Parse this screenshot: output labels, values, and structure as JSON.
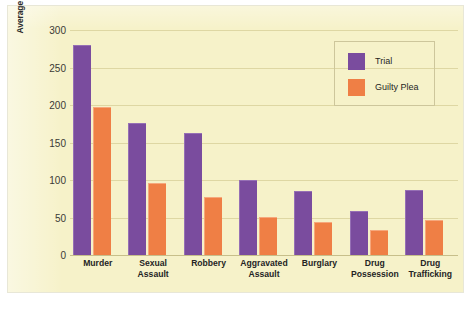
{
  "chart_data": {
    "type": "bar",
    "title": "",
    "xlabel": "",
    "ylabel": "Average Maximum Prison Sentence (in Months) for Convictions",
    "ylim": [
      0,
      300
    ],
    "yticks": [
      0,
      50,
      100,
      150,
      200,
      250,
      300
    ],
    "ytick_labels": [
      "0",
      "50",
      "100",
      "150",
      "200",
      "250",
      "300"
    ],
    "grid": true,
    "legend_position": "top-right",
    "categories": [
      "Murder",
      "Sexual Assault",
      "Robbery",
      "Aggravated Assault",
      "Burglary",
      "Drug Possession",
      "Drug Trafficking"
    ],
    "category_lines": [
      [
        "Murder"
      ],
      [
        "Sexual",
        "Assault"
      ],
      [
        "Robbery"
      ],
      [
        "Aggravated",
        "Assault"
      ],
      [
        "Burglary"
      ],
      [
        "Drug",
        "Possession"
      ],
      [
        "Drug",
        "Trafficking"
      ]
    ],
    "series": [
      {
        "name": "Trial",
        "color": "#7a4c9e",
        "values": [
          280,
          176,
          163,
          100,
          85,
          59,
          87
        ]
      },
      {
        "name": "Guilty Plea",
        "color": "#ef7f45",
        "values": [
          197,
          96,
          77,
          51,
          44,
          33,
          47
        ]
      }
    ]
  },
  "legend": {
    "items": [
      {
        "label": "Trial",
        "color": "#7a4c9e"
      },
      {
        "label": "Guilty Plea",
        "color": "#ef7f45"
      }
    ]
  },
  "colors": {
    "panel_background": "#f6f2c9",
    "page_background": "#ffffff",
    "gridline": "#d6ce96",
    "trial": "#7a4c9e",
    "guilty_plea": "#ef7f45",
    "text": "#242424"
  }
}
